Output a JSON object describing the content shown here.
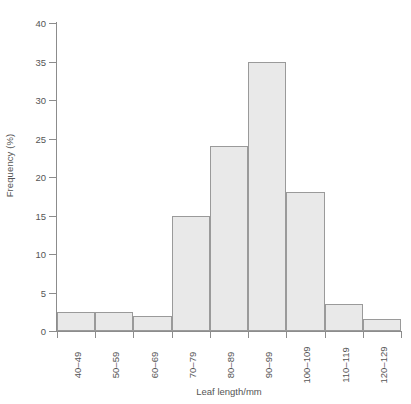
{
  "chart_data": {
    "type": "bar",
    "title": "",
    "subtitle": "",
    "xlabel": "Leaf length/mm",
    "ylabel": "Frequency (%)",
    "categories": [
      "40–49",
      "50–59",
      "60–69",
      "70–79",
      "80–89",
      "90–99",
      "100–109",
      "110–119",
      "120–129"
    ],
    "values": [
      2.5,
      2.5,
      2,
      15,
      24,
      35,
      18,
      3.5,
      1.5
    ],
    "ylim": [
      0,
      40
    ],
    "ytick_values": [
      0,
      5,
      10,
      15,
      20,
      25,
      30,
      35,
      40
    ],
    "ytick_labels": [
      "0",
      "5",
      "10",
      "15",
      "20",
      "25",
      "30",
      "35",
      "40"
    ],
    "grid": false,
    "legend": false,
    "legend_position": "none",
    "bar_fill_color": "#e9e9e9",
    "bar_border_color": "#9a9a9a",
    "axis_color": "#8c8c8c",
    "text_color": "#555555",
    "background_color": "#ffffff",
    "xtick_label_rotation": 90,
    "bars_contiguous": true
  }
}
